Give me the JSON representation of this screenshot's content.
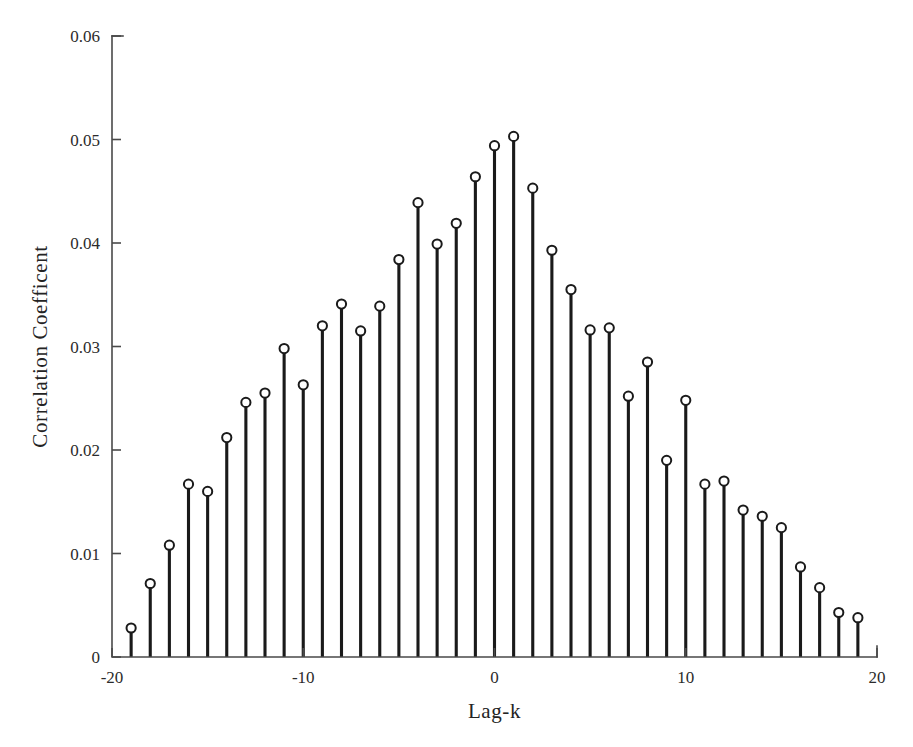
{
  "chart_data": {
    "type": "scatter",
    "plot_style": "stem",
    "title": "",
    "xlabel": "Lag-k",
    "ylabel": "Correlation Coefficent",
    "xlim": [
      -20,
      20
    ],
    "ylim": [
      0,
      0.06
    ],
    "xticks": [
      -20,
      -10,
      0,
      10,
      20
    ],
    "xtick_labels": [
      "-20",
      "-10",
      "0",
      "10",
      "20"
    ],
    "yticks": [
      0,
      0.01,
      0.02,
      0.03,
      0.04,
      0.05,
      0.06
    ],
    "ytick_labels": [
      "0",
      "0.01",
      "0.02",
      "0.03",
      "0.04",
      "0.05",
      "0.06"
    ],
    "grid": false,
    "legend": null,
    "marker": "open-circle",
    "series": [
      {
        "name": "Correlation Coefficent",
        "x": [
          -19,
          -18,
          -17,
          -16,
          -15,
          -14,
          -13,
          -12,
          -11,
          -10,
          -9,
          -8,
          -7,
          -6,
          -5,
          -4,
          -3,
          -2,
          -1,
          0,
          1,
          2,
          3,
          4,
          5,
          6,
          7,
          8,
          9,
          10,
          11,
          12,
          13,
          14,
          15,
          16,
          17,
          18,
          19
        ],
        "values": [
          0.0028,
          0.0071,
          0.0108,
          0.0167,
          0.016,
          0.0212,
          0.0246,
          0.0255,
          0.0298,
          0.0263,
          0.032,
          0.0341,
          0.0315,
          0.0339,
          0.0384,
          0.0439,
          0.0399,
          0.0419,
          0.0464,
          0.0494,
          0.0503,
          0.0453,
          0.0393,
          0.0355,
          0.0316,
          0.0318,
          0.0252,
          0.0285,
          0.019,
          0.0248,
          0.0167,
          0.017,
          0.0142,
          0.0136,
          0.0125,
          0.0087,
          0.0067,
          0.0043,
          0.0038
        ]
      }
    ],
    "colors": {
      "stem": "#1a1a1a",
      "marker_face": "#ffffff",
      "marker_edge": "#1a1a1a",
      "axis": "#4a4a4a",
      "background": "#ffffff"
    }
  }
}
